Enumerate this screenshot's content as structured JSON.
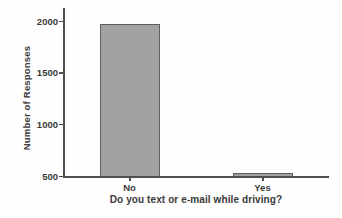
{
  "chart_data": {
    "type": "bar",
    "categories": [
      "No",
      "Yes"
    ],
    "values": [
      1975,
      530
    ],
    "title": "",
    "xlabel": "Do you text or e-mail while driving?",
    "ylabel": "Number of Responses",
    "ylim": [
      500,
      2000
    ],
    "yticks": [
      500,
      1000,
      1500,
      2000
    ],
    "grid": false,
    "legend": false,
    "colors": {
      "bar_fill": "#a2a2a2",
      "bar_border": "#5e5e5e",
      "axis": "#4f4f4f",
      "text": "#3a3a3a",
      "background": "#fefefe"
    }
  }
}
